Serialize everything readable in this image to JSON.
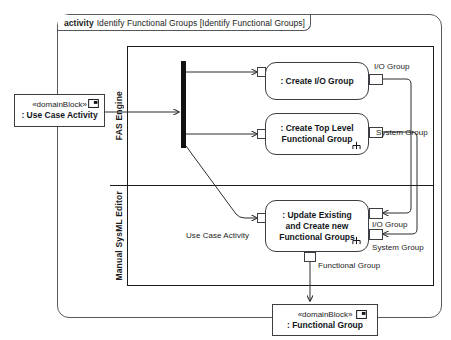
{
  "diagram": {
    "kind_keyword": "activity",
    "title": "Identify Functional Groups [Identify Functional Groups]"
  },
  "partitions": [
    {
      "name": "FAS Engine"
    },
    {
      "name": "Manual SysML Editor"
    }
  ],
  "blocks": {
    "source": {
      "stereotype": "«domainBlock»",
      "name": ": Use Case Activity",
      "icon": "block-icon"
    },
    "target": {
      "stereotype": "«domainBlock»",
      "name": ": Functional Group",
      "icon": "block-icon"
    }
  },
  "nodes": {
    "fork": {
      "name": "fork-node"
    },
    "create_io_group": {
      "label": ": Create I/O Group",
      "partition": "FAS Engine"
    },
    "create_top_level": {
      "label": ": Create Top Level Functional Group",
      "partition": "FAS Engine",
      "icon": "rake-icon"
    },
    "update_existing": {
      "label": ": Update Existing and Create new Functional Groups",
      "partition": "Manual SysML Editor",
      "icon": "rake-icon"
    }
  },
  "pins": {
    "io_group_out": "I/O Group",
    "system_group_out": "System Group",
    "io_group_in": "I/O Group",
    "system_group_in": "System Group",
    "functional_group_out": "Functional Group"
  },
  "edge_labels": {
    "use_case_activity": "Use Case Activity"
  },
  "colors": {
    "frame_line": "#55585c",
    "partition_line": "#1b1b1b",
    "node_line": "#3b3e42",
    "fork_fill": "#111111",
    "text": "#12161a",
    "background": "#ffffff"
  }
}
